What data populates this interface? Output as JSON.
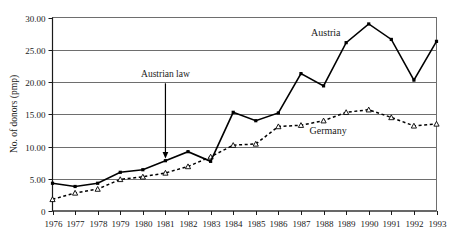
{
  "chart_data": {
    "type": "line",
    "title": "",
    "xlabel": "",
    "ylabel": "No. of donors (pmp)",
    "x": [
      1976,
      1977,
      1978,
      1979,
      1980,
      1981,
      1982,
      1983,
      1984,
      1985,
      1986,
      1987,
      1988,
      1989,
      1990,
      1991,
      1992,
      1993
    ],
    "categories": [
      "1976",
      "1977",
      "1978",
      "1979",
      "1980",
      "1981",
      "1982",
      "1983",
      "1984",
      "1985",
      "1986",
      "1987",
      "1988",
      "1989",
      "1990",
      "1991",
      "1992",
      "1993"
    ],
    "series": [
      {
        "name": "Austria",
        "values": [
          4.3,
          3.8,
          4.3,
          6.0,
          6.4,
          7.8,
          9.2,
          7.7,
          15.3,
          14.0,
          15.2,
          21.3,
          19.4,
          26.1,
          29.0,
          26.6,
          20.3,
          26.3
        ],
        "style": "solid",
        "marker": "filled-square",
        "color": "#000000"
      },
      {
        "name": "Germany",
        "values": [
          1.8,
          2.8,
          3.4,
          4.9,
          5.3,
          5.9,
          6.9,
          8.4,
          10.2,
          10.4,
          13.1,
          13.3,
          14.0,
          15.3,
          15.7,
          14.5,
          13.2,
          13.5
        ],
        "style": "dotted",
        "marker": "open-triangle",
        "color": "#000000"
      }
    ],
    "ylim": [
      0,
      30
    ],
    "yticks": [
      0,
      5,
      10,
      15,
      20,
      25,
      30
    ],
    "ytick_labels": [
      "0",
      "5.00",
      "10.00",
      "15.00",
      "20.00",
      "25.00",
      "30.00"
    ],
    "grid": "horizontal",
    "legend": "inline-labels",
    "annotations": [
      {
        "text": "Austrian law",
        "x": 1981,
        "points_to_y": 8.0,
        "type": "arrow-down"
      }
    ],
    "series_labels": [
      {
        "text": "Austria",
        "x": 1988.1,
        "y": 27.2
      },
      {
        "text": "Germany",
        "x": 1988.2,
        "y": 12.0
      }
    ]
  }
}
